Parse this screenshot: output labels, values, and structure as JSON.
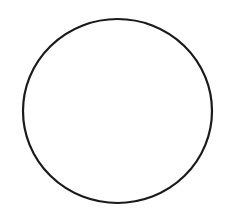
{
  "canvas": {
    "width": 228,
    "height": 222,
    "background": "#ffffff"
  },
  "shapes": [
    {
      "type": "ellipse",
      "cx": 117.5,
      "cy": 111,
      "rx": 94.5,
      "ry": 92,
      "stroke": "#1a1a1a",
      "stroke_width": 2.2,
      "fill": "none"
    }
  ]
}
